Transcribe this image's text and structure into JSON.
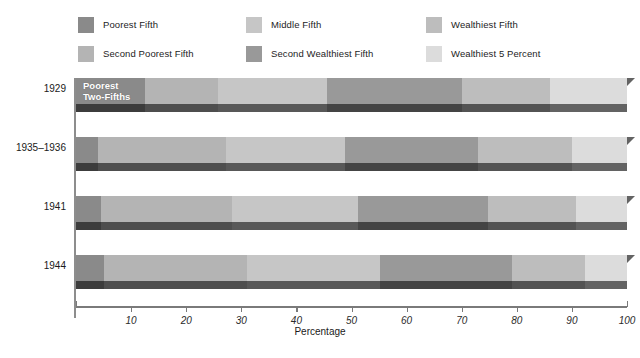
{
  "chart_data": {
    "type": "bar",
    "orientation": "horizontal",
    "stacked": true,
    "title": "",
    "xlabel": "Percentage",
    "ylabel": "",
    "xlim": [
      0,
      100
    ],
    "xticks": [
      10,
      20,
      30,
      40,
      50,
      60,
      70,
      80,
      90,
      100
    ],
    "xticklabels": [
      "10",
      "20",
      "30",
      "40",
      "50",
      "60",
      "70",
      "80",
      "90",
      "100"
    ],
    "grid": false,
    "legend_position": "top",
    "categories": [
      "1929",
      "1935–1936",
      "1941",
      "1944"
    ],
    "series": [
      {
        "name": "Poorest Fifth",
        "color": "#8a8a8a",
        "values": [
          12.5,
          4.0,
          4.5,
          5.0
        ]
      },
      {
        "name": "Second Poorest Fifth",
        "color": "#b4b4b4",
        "values": [
          13.3,
          23.2,
          23.8,
          26.0
        ]
      },
      {
        "name": "Middle Fifth",
        "color": "#c6c6c6",
        "values": [
          19.7,
          21.6,
          22.9,
          24.2
        ]
      },
      {
        "name": "Second Wealthiest Fifth",
        "color": "#999999",
        "values": [
          24.5,
          24.2,
          23.6,
          23.9
        ]
      },
      {
        "name": "Wealthiest Fifth",
        "color": "#bdbdbd",
        "values": [
          16.0,
          17.0,
          16.0,
          13.2
        ]
      },
      {
        "name": "Wealthiest 5 Percent",
        "color": "#dcdcdc",
        "values": [
          14.0,
          10.0,
          9.2,
          7.7
        ]
      }
    ],
    "annotations": [
      {
        "text": "Poorest\nTwo-Fifths",
        "row": "1929",
        "at_series": "Poorest Fifth"
      }
    ]
  },
  "legend": {
    "items": [
      {
        "label": "Poorest Fifth",
        "color": "#8a8a8a"
      },
      {
        "label": "Middle Fifth",
        "color": "#c6c6c6"
      },
      {
        "label": "Wealthiest Fifth",
        "color": "#bdbdbd"
      },
      {
        "label": "Second Poorest Fifth",
        "color": "#b4b4b4"
      },
      {
        "label": "Second Wealthiest Fifth",
        "color": "#999999"
      },
      {
        "label": "Wealthiest 5 Percent",
        "color": "#dcdcdc"
      }
    ]
  },
  "axis": {
    "x_title": "Percentage",
    "ticks": [
      "10",
      "20",
      "30",
      "40",
      "50",
      "60",
      "70",
      "80",
      "90",
      "100"
    ]
  },
  "rows": [
    {
      "label": "1929",
      "inbar_label": "Poorest\nTwo-Fifths",
      "segments": [
        {
          "name": "Poorest Fifth",
          "value": 12.5,
          "color": "#8a8a8a",
          "base": "#3c3c3c"
        },
        {
          "name": "Second Poorest Fifth",
          "value": 13.3,
          "color": "#b4b4b4",
          "base": "#4e4e4e"
        },
        {
          "name": "Middle Fifth",
          "value": 19.7,
          "color": "#c6c6c6",
          "base": "#585858"
        },
        {
          "name": "Second Wealthiest Fifth",
          "value": 24.5,
          "color": "#999999",
          "base": "#444444"
        },
        {
          "name": "Wealthiest Fifth",
          "value": 16.0,
          "color": "#bdbdbd",
          "base": "#535353"
        },
        {
          "name": "Wealthiest 5 Percent",
          "value": 14.0,
          "color": "#dcdcdc",
          "base": "#636363"
        }
      ]
    },
    {
      "label": "1935–1936",
      "inbar_label": "",
      "segments": [
        {
          "name": "Poorest Fifth",
          "value": 4.0,
          "color": "#8a8a8a",
          "base": "#3c3c3c"
        },
        {
          "name": "Second Poorest Fifth",
          "value": 23.2,
          "color": "#b4b4b4",
          "base": "#4e4e4e"
        },
        {
          "name": "Middle Fifth",
          "value": 21.6,
          "color": "#c6c6c6",
          "base": "#585858"
        },
        {
          "name": "Second Wealthiest Fifth",
          "value": 24.2,
          "color": "#999999",
          "base": "#444444"
        },
        {
          "name": "Wealthiest Fifth",
          "value": 17.0,
          "color": "#bdbdbd",
          "base": "#535353"
        },
        {
          "name": "Wealthiest 5 Percent",
          "value": 10.0,
          "color": "#dcdcdc",
          "base": "#636363"
        }
      ]
    },
    {
      "label": "1941",
      "inbar_label": "",
      "segments": [
        {
          "name": "Poorest Fifth",
          "value": 4.5,
          "color": "#8a8a8a",
          "base": "#3c3c3c"
        },
        {
          "name": "Second Poorest Fifth",
          "value": 23.8,
          "color": "#b4b4b4",
          "base": "#4e4e4e"
        },
        {
          "name": "Middle Fifth",
          "value": 22.9,
          "color": "#c6c6c6",
          "base": "#585858"
        },
        {
          "name": "Second Wealthiest Fifth",
          "value": 23.6,
          "color": "#999999",
          "base": "#444444"
        },
        {
          "name": "Wealthiest Fifth",
          "value": 16.0,
          "color": "#bdbdbd",
          "base": "#535353"
        },
        {
          "name": "Wealthiest 5 Percent",
          "value": 9.2,
          "color": "#dcdcdc",
          "base": "#636363"
        }
      ]
    },
    {
      "label": "1944",
      "inbar_label": "",
      "segments": [
        {
          "name": "Poorest Fifth",
          "value": 5.0,
          "color": "#8a8a8a",
          "base": "#3c3c3c"
        },
        {
          "name": "Second Poorest Fifth",
          "value": 26.0,
          "color": "#b4b4b4",
          "base": "#4e4e4e"
        },
        {
          "name": "Middle Fifth",
          "value": 24.2,
          "color": "#c6c6c6",
          "base": "#585858"
        },
        {
          "name": "Second Wealthiest Fifth",
          "value": 23.9,
          "color": "#999999",
          "base": "#444444"
        },
        {
          "name": "Wealthiest Fifth",
          "value": 13.2,
          "color": "#bdbdbd",
          "base": "#535353"
        },
        {
          "name": "Wealthiest 5 Percent",
          "value": 7.7,
          "color": "#dcdcdc",
          "base": "#636363"
        }
      ]
    }
  ]
}
